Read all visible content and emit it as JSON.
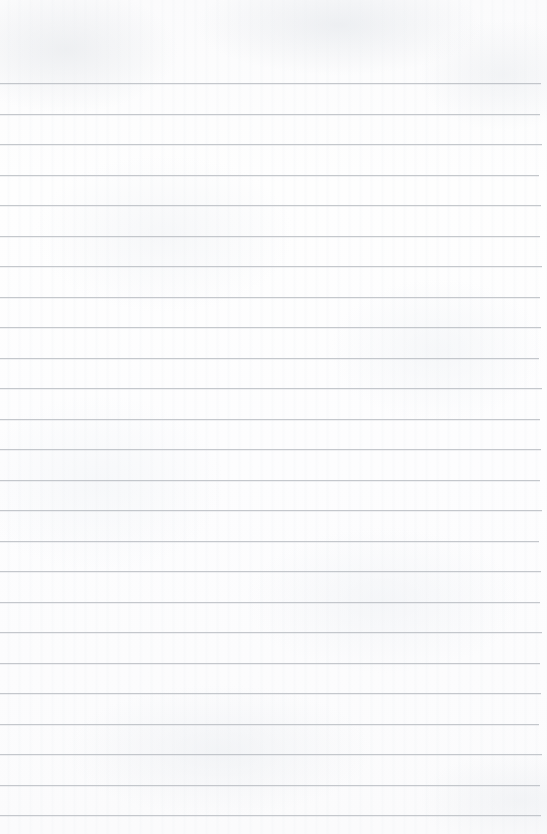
{
  "page": {
    "kind": "ruled-notebook-paper",
    "width": 547,
    "height": 834,
    "content_text": "",
    "has_handwriting": false,
    "has_printed_text": false,
    "has_margin_rule": false,
    "background_color": "#fdfdfd",
    "rule_color": "#b5b9bf"
  },
  "ruling": {
    "line_count": 25,
    "spacing_px": 30.5,
    "first_line_y": 83,
    "last_line_y": 815,
    "line_thickness_px": 1,
    "line_left_x": 0,
    "line_right_x": 540,
    "lines": [
      {
        "index": 1,
        "y": 83,
        "x_start": 0,
        "x_end": 541,
        "text": ""
      },
      {
        "index": 2,
        "y": 114,
        "x_start": 0,
        "x_end": 540,
        "text": ""
      },
      {
        "index": 3,
        "y": 144,
        "x_start": 0,
        "x_end": 542,
        "text": ""
      },
      {
        "index": 4,
        "y": 175,
        "x_start": 0,
        "x_end": 539,
        "text": ""
      },
      {
        "index": 5,
        "y": 205,
        "x_start": 0,
        "x_end": 541,
        "text": ""
      },
      {
        "index": 6,
        "y": 236,
        "x_start": 0,
        "x_end": 540,
        "text": ""
      },
      {
        "index": 7,
        "y": 266,
        "x_start": 0,
        "x_end": 542,
        "text": ""
      },
      {
        "index": 8,
        "y": 297,
        "x_start": 0,
        "x_end": 540,
        "text": ""
      },
      {
        "index": 9,
        "y": 327,
        "x_start": 0,
        "x_end": 541,
        "text": ""
      },
      {
        "index": 10,
        "y": 358,
        "x_start": 0,
        "x_end": 539,
        "text": ""
      },
      {
        "index": 11,
        "y": 388,
        "x_start": 0,
        "x_end": 542,
        "text": ""
      },
      {
        "index": 12,
        "y": 419,
        "x_start": 0,
        "x_end": 540,
        "text": ""
      },
      {
        "index": 13,
        "y": 449,
        "x_start": 0,
        "x_end": 541,
        "text": ""
      },
      {
        "index": 14,
        "y": 480,
        "x_start": 0,
        "x_end": 540,
        "text": ""
      },
      {
        "index": 15,
        "y": 510,
        "x_start": 0,
        "x_end": 542,
        "text": ""
      },
      {
        "index": 16,
        "y": 541,
        "x_start": 0,
        "x_end": 539,
        "text": ""
      },
      {
        "index": 17,
        "y": 571,
        "x_start": 0,
        "x_end": 541,
        "text": ""
      },
      {
        "index": 18,
        "y": 602,
        "x_start": 0,
        "x_end": 540,
        "text": ""
      },
      {
        "index": 19,
        "y": 632,
        "x_start": 0,
        "x_end": 542,
        "text": ""
      },
      {
        "index": 20,
        "y": 663,
        "x_start": 0,
        "x_end": 540,
        "text": ""
      },
      {
        "index": 21,
        "y": 693,
        "x_start": 0,
        "x_end": 541,
        "text": ""
      },
      {
        "index": 22,
        "y": 724,
        "x_start": 0,
        "x_end": 539,
        "text": ""
      },
      {
        "index": 23,
        "y": 754,
        "x_start": 0,
        "x_end": 542,
        "text": ""
      },
      {
        "index": 24,
        "y": 785,
        "x_start": 0,
        "x_end": 540,
        "text": ""
      },
      {
        "index": 25,
        "y": 815,
        "x_start": 0,
        "x_end": 541,
        "text": ""
      }
    ]
  },
  "margins": {
    "top_blank_px": 83,
    "bottom_blank_px": 19,
    "right_blank_px": 6
  }
}
